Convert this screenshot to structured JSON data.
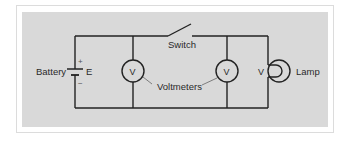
{
  "diagram": {
    "type": "electric-circuit",
    "background_color": "#d9d9d9",
    "wire_color": "#222222",
    "labels": {
      "battery": "Battery",
      "emf": "E",
      "plus": "+",
      "minus": "−",
      "switch": "Switch",
      "voltmeters": "Voltmeters",
      "voltmeter_symbol_1": "V",
      "voltmeter_symbol_2": "V",
      "lamp_voltage": "V",
      "lamp": "Lamp"
    },
    "components": [
      {
        "id": "battery",
        "label": "Battery",
        "symbol": "E"
      },
      {
        "id": "switch",
        "label": "Switch",
        "state": "open"
      },
      {
        "id": "voltmeter-1",
        "symbol": "V"
      },
      {
        "id": "voltmeter-2",
        "symbol": "V"
      },
      {
        "id": "lamp",
        "label": "Lamp",
        "voltage_symbol": "V"
      }
    ]
  }
}
